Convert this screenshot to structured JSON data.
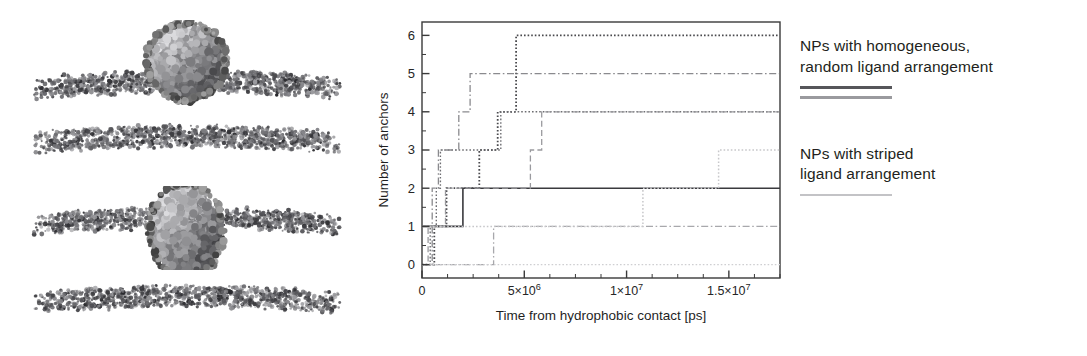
{
  "figure": {
    "kind": "scientific-figure",
    "panels": [
      "snapshots",
      "plot",
      "legend"
    ]
  },
  "snapshots": {
    "name": "md-simulation-snapshots",
    "items": [
      {
        "id": "snapshot-1",
        "label": "nanoparticle adsorbed on bilayer",
        "has_particle": true,
        "particle_mode": "on-top"
      },
      {
        "id": "snapshot-2",
        "label": "bare lipid bilayer",
        "has_particle": false,
        "particle_mode": "none"
      },
      {
        "id": "snapshot-3",
        "label": "nanoparticle embedded in bilayer",
        "has_particle": true,
        "particle_mode": "embedded"
      },
      {
        "id": "snapshot-4",
        "label": "bare lipid bilayer",
        "has_particle": false,
        "particle_mode": "none"
      }
    ]
  },
  "legend": {
    "groups": [
      {
        "id": "legend-homogeneous",
        "text_line_1": "NPs with homogeneous,",
        "text_line_2": "random ligand arrangement",
        "swatch_colors": [
          "#56565a",
          "#9a9a9e"
        ]
      },
      {
        "id": "legend-striped",
        "text_line_1": "NPs with striped",
        "text_line_2": "ligand arrangement",
        "swatch_colors": [
          "#c3c3c6"
        ]
      }
    ]
  },
  "chart_data": {
    "type": "line",
    "step": "post",
    "title": "",
    "xlabel": "Time from hydrophobic contact [ps]",
    "ylabel": "Number of anchors",
    "xlim": [
      0,
      17500000
    ],
    "ylim": [
      -0.35,
      6.35
    ],
    "grid": false,
    "legend_position": "outside-right",
    "xticks": [
      0,
      5000000,
      10000000,
      15000000
    ],
    "xticklabels": [
      "0",
      "5×10⁶",
      "1×10⁷",
      "1.5×10⁷"
    ],
    "xminorticks": [
      1250000,
      2500000,
      3750000,
      6250000,
      7500000,
      8750000,
      11250000,
      12500000,
      13750000,
      16250000,
      17500000
    ],
    "yticks": [
      0,
      1,
      2,
      3,
      4,
      5,
      6
    ],
    "yticklabels": [
      "0",
      "1",
      "2",
      "3",
      "4",
      "5",
      "6"
    ],
    "yminorticks": [
      0.5,
      1.5,
      2.5,
      3.5,
      4.5,
      5.5
    ],
    "series": [
      {
        "name": "homogeneous-run-1",
        "group": "homogeneous",
        "color": "#3a3a3e",
        "dash": "solid",
        "width": 1.6,
        "x": [
          0,
          1950000,
          2000000,
          17500000
        ],
        "y": [
          1,
          1,
          2,
          2
        ]
      },
      {
        "name": "homogeneous-run-2",
        "group": "homogeneous",
        "color": "#4a4a4e",
        "dash": "dotted",
        "width": 1.8,
        "x": [
          0,
          600000,
          1200000,
          2800000,
          3700000,
          4600000,
          7300000
        ],
        "y": [
          0,
          1,
          2,
          3,
          4,
          6,
          6
        ]
      },
      {
        "name": "homogeneous-run-3",
        "group": "homogeneous",
        "color": "#6e6e72",
        "dash": "dotted",
        "width": 1.4,
        "x": [
          0,
          400000,
          700000,
          900000,
          3850000,
          17500000
        ],
        "y": [
          0,
          1,
          2,
          3,
          4,
          4
        ]
      },
      {
        "name": "homogeneous-run-4",
        "group": "homogeneous",
        "color": "#8a8a8e",
        "dash": "dashdot",
        "width": 1.3,
        "x": [
          0,
          500000,
          800000,
          1800000,
          2350000,
          9700000
        ],
        "y": [
          0,
          2,
          3,
          4,
          5,
          5
        ]
      },
      {
        "name": "homogeneous-run-5",
        "group": "homogeneous",
        "color": "#9a9a9e",
        "dash": "dashed",
        "width": 1.3,
        "x": [
          0,
          300000,
          1150000,
          3200000,
          5300000,
          5850000,
          11450000
        ],
        "y": [
          0,
          1,
          2,
          2,
          3,
          4,
          4
        ]
      },
      {
        "name": "homogeneous-run-6",
        "group": "homogeneous",
        "color": "#a8a8ac",
        "dash": "dashdot",
        "width": 1.3,
        "x": [
          0,
          150000,
          3450000,
          3500000,
          17500000
        ],
        "y": [
          0,
          0,
          0,
          1,
          1
        ]
      },
      {
        "name": "striped-run-1",
        "group": "striped",
        "color": "#c7c7ca",
        "dash": "dotted",
        "width": 1.5,
        "x": [
          0,
          250000,
          10800000,
          14500000,
          17500000
        ],
        "y": [
          1,
          1,
          2,
          3,
          3
        ]
      },
      {
        "name": "striped-run-2",
        "group": "striped",
        "color": "#cfcfd2",
        "dash": "dotted",
        "width": 1.3,
        "x": [
          0,
          200000,
          17500000
        ],
        "y": [
          0,
          0,
          0
        ]
      }
    ]
  }
}
